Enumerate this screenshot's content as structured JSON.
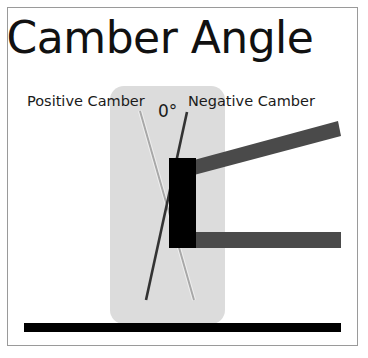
{
  "title": "Camber Angle",
  "labels": {
    "positive": "Positive Camber",
    "zero": "0°",
    "negative": "Negative Camber"
  },
  "colors": {
    "frame": "#9a9a9a",
    "wheel_area": "#dcdcdc",
    "positive_line": "#a8a8a8",
    "negative_line": "#3a3a3a",
    "hub": "#000000",
    "control_arm": "#4a4a4a",
    "ground": "#000000"
  }
}
